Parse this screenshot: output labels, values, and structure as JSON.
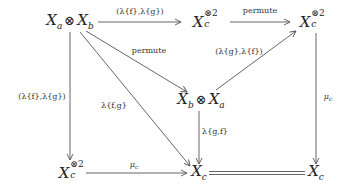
{
  "diagram": {
    "type": "commutative-diagram",
    "nodes": {
      "top_left": {
        "base": "X",
        "sub_a": "a",
        "op": "⊗",
        "base2": "X",
        "sub_b": "b"
      },
      "top_mid": {
        "base": "X",
        "sup": "⊗2",
        "sub": "c"
      },
      "top_right": {
        "base": "X",
        "sup": "⊗2",
        "sub": "c"
      },
      "mid": {
        "base": "X",
        "sub_a": "b",
        "op": "⊗",
        "base2": "X",
        "sub_b": "a"
      },
      "bottom_left": {
        "base": "X",
        "sup": "⊗2",
        "sub": "c"
      },
      "bottom_mid": {
        "base": "X",
        "sub": "c"
      },
      "bottom_right": {
        "base": "X",
        "sub": "c"
      }
    },
    "arrows": [
      {
        "from": "top_left",
        "to": "top_mid",
        "label": "(λ{f},λ{g})"
      },
      {
        "from": "top_mid",
        "to": "top_right",
        "label": "permute"
      },
      {
        "from": "top_left",
        "to": "mid",
        "label": "permute"
      },
      {
        "from": "mid",
        "to": "top_right",
        "label": "(λ{g},λ{f})"
      },
      {
        "from": "top_left",
        "to": "bottom_left",
        "label": "(λ{f},λ{g})"
      },
      {
        "from": "top_left",
        "to": "bottom_mid",
        "label": "λ{f,g}"
      },
      {
        "from": "mid",
        "to": "bottom_mid",
        "label": "λ{g,f}"
      },
      {
        "from": "top_right",
        "to": "bottom_right",
        "label": "μc"
      },
      {
        "from": "bottom_left",
        "to": "bottom_mid",
        "label": "μc"
      },
      {
        "from": "bottom_mid",
        "to": "bottom_right",
        "label": "=",
        "style": "double"
      }
    ],
    "labels": {
      "tl_tm": "(λ{f},λ{g})",
      "tm_tr": "permute",
      "tl_mid": "permute",
      "mid_tr": "(λ{g},λ{f})",
      "tl_bl": "(λ{f},λ{g})",
      "tl_bm": "λ{f,g}",
      "mid_bm": "λ{g,f}",
      "tr_br_base": "μ",
      "tr_br_sub": "c",
      "bl_bm_base": "μ",
      "bl_bm_sub": "c"
    }
  }
}
